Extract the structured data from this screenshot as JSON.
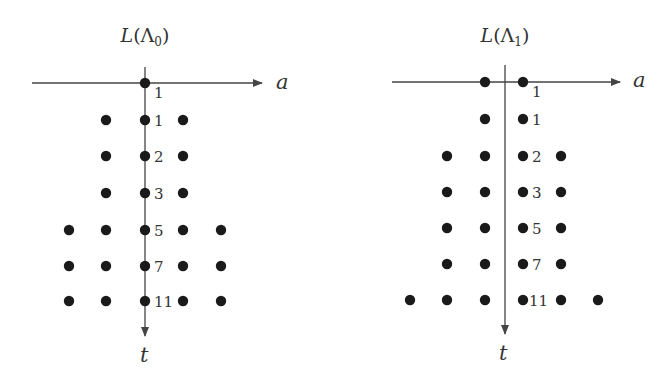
{
  "panels": [
    {
      "title": "L(Λ₀)",
      "title_main": "L(Λ",
      "title_sub": "0",
      "title_close": ")",
      "axis_x_label": "a",
      "axis_y_label": "t",
      "origin_x": 145,
      "axis_y_pos": 83,
      "h_axis": [
        32,
        262
      ],
      "v_axis": [
        67,
        336
      ],
      "columns_x": [
        69,
        106,
        145,
        183,
        221
      ],
      "rows": [
        {
          "y": 83,
          "label": "1",
          "label_x": 154,
          "label_y": 98,
          "cols": [
            2
          ]
        },
        {
          "y": 120,
          "label": "1",
          "label_x": 154,
          "label_y": 126,
          "cols": [
            1,
            2,
            3
          ]
        },
        {
          "y": 156,
          "label": "2",
          "label_x": 154,
          "label_y": 162,
          "cols": [
            1,
            2,
            3
          ]
        },
        {
          "y": 193,
          "label": "3",
          "label_x": 154,
          "label_y": 199,
          "cols": [
            1,
            2,
            3
          ]
        },
        {
          "y": 230,
          "label": "5",
          "label_x": 154,
          "label_y": 236,
          "cols": [
            0,
            1,
            2,
            3,
            4
          ]
        },
        {
          "y": 266,
          "label": "7",
          "label_x": 154,
          "label_y": 272,
          "cols": [
            0,
            1,
            2,
            3,
            4
          ]
        },
        {
          "y": 301,
          "label": "11",
          "label_x": 154,
          "label_y": 307,
          "cols": [
            0,
            1,
            2,
            3,
            4
          ]
        }
      ],
      "label_a_pos": [
        276,
        89
      ],
      "label_t_pos": [
        140,
        362
      ],
      "title_pos": [
        145,
        42
      ]
    },
    {
      "title": "L(Λ₁)",
      "title_main": "L(Λ",
      "title_sub": "1",
      "title_close": ")",
      "axis_x_label": "a",
      "axis_y_label": "t",
      "origin_x": 505,
      "axis_y_pos": 82,
      "h_axis": [
        392,
        620
      ],
      "v_axis": [
        65,
        334
      ],
      "columns_x": [
        410,
        447,
        485,
        523,
        561,
        598
      ],
      "rows": [
        {
          "y": 82,
          "label": "1",
          "label_x": 532,
          "label_y": 97,
          "cols": [
            2,
            3
          ]
        },
        {
          "y": 119,
          "label": "1",
          "label_x": 532,
          "label_y": 125,
          "cols": [
            2,
            3
          ]
        },
        {
          "y": 156,
          "label": "2",
          "label_x": 532,
          "label_y": 162,
          "cols": [
            1,
            2,
            3,
            4
          ]
        },
        {
          "y": 192,
          "label": "3",
          "label_x": 532,
          "label_y": 198,
          "cols": [
            1,
            2,
            3,
            4
          ]
        },
        {
          "y": 228,
          "label": "5",
          "label_x": 532,
          "label_y": 234,
          "cols": [
            1,
            2,
            3,
            4
          ]
        },
        {
          "y": 264,
          "label": "7",
          "label_x": 532,
          "label_y": 270,
          "cols": [
            1,
            2,
            3,
            4
          ]
        },
        {
          "y": 300,
          "label": "11",
          "label_x": 529,
          "label_y": 306,
          "cols": [
            0,
            1,
            2,
            3,
            4,
            5
          ]
        }
      ],
      "label_a_pos": [
        633,
        87
      ],
      "label_t_pos": [
        499,
        360
      ],
      "title_pos": [
        505,
        42
      ]
    }
  ],
  "colors": {
    "dot": "#1a1a1a",
    "axis": "#444444",
    "text": "#333333",
    "background": "#ffffff"
  }
}
